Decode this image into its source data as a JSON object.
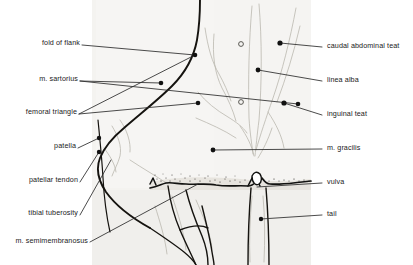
{
  "figure": {
    "type": "labeled-anatomical-line-drawing",
    "width": 413,
    "height": 265,
    "colors": {
      "background": "#ffffff",
      "drawing_wash": "#f2f1ee",
      "outline_dark": "#111111",
      "outline_light": "#b9b6ae",
      "leader_line": "#2b2b2b",
      "label_text": "#1a1a1a"
    }
  },
  "labels_left": [
    {
      "id": "fold-of-flank",
      "text": "fold of flank",
      "x": 26,
      "y": 42,
      "leader_to_x": 195,
      "leader_to_y": 55,
      "dot": true
    },
    {
      "id": "m-sartorius",
      "text": "m. sartorius",
      "x": 33,
      "y": 78,
      "leader_to_x": 298,
      "leader_to_y": 104,
      "dot": true
    },
    {
      "id": "femoral-triangle",
      "text": "femoral triangle",
      "x": 14,
      "y": 112,
      "leader_to_x": 195,
      "leader_to_y": 55,
      "dot": true
    },
    {
      "id": "patella",
      "text": "patella",
      "x": 60,
      "y": 145,
      "leader_to_x": 99,
      "leader_to_y": 138,
      "dot": true
    },
    {
      "id": "patellar-tendon",
      "text": "patellar tendon",
      "x": 19,
      "y": 180,
      "leader_to_x": 99,
      "leader_to_y": 152,
      "dot": true
    },
    {
      "id": "tibial-tuberosity",
      "text": "tibial tuberosity",
      "x": 19,
      "y": 212,
      "leader_to_x": 111,
      "leader_to_y": 160,
      "dot": false
    },
    {
      "id": "m-semimembranosus",
      "text": "m. semimembranosus",
      "x": 3,
      "y": 240,
      "leader_to_x": 198,
      "leader_to_y": 184,
      "dot": false
    }
  ],
  "labels_right": [
    {
      "id": "caudal-abdominal-teat",
      "text": "caudal abdominal teat",
      "x": 327,
      "y": 45,
      "leader_to_x": 280,
      "leader_to_y": 43,
      "dot": true
    },
    {
      "id": "linea-alba",
      "text": "linea alba",
      "x": 327,
      "y": 79,
      "leader_to_x": 258,
      "leader_to_y": 70,
      "dot": true
    },
    {
      "id": "inguinal-teat",
      "text": "inguinal teat",
      "x": 327,
      "y": 113,
      "leader_to_x": 284,
      "leader_to_y": 103,
      "dot": true
    },
    {
      "id": "m-gracilis",
      "text": "m. gracilis",
      "x": 327,
      "y": 147,
      "leader_to_x": 213,
      "leader_to_y": 150,
      "dot": true
    },
    {
      "id": "vulva",
      "text": "vulva",
      "x": 327,
      "y": 181,
      "leader_to_x": 257,
      "leader_to_y": 187,
      "dot": true
    },
    {
      "id": "tail",
      "text": "tail",
      "x": 327,
      "y": 213,
      "leader_to_x": 261,
      "leader_to_y": 219,
      "dot": true
    }
  ],
  "markers": {
    "open_circles": [
      {
        "id": "teat-opening-upper",
        "x": 241,
        "y": 44,
        "r": 2.4
      },
      {
        "id": "teat-opening-lower",
        "x": 241,
        "y": 102,
        "r": 2.4
      }
    ]
  }
}
